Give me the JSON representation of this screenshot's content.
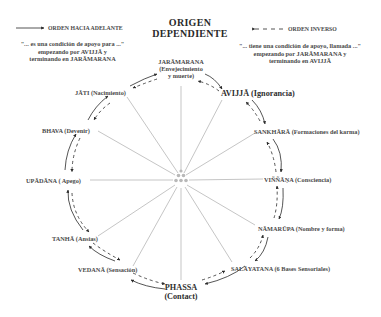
{
  "title": {
    "line1": "ORIGEN",
    "line2": "DEPENDIENTE"
  },
  "legend": {
    "forward": {
      "label": "ORDEN HACIA ADELANTE",
      "line_style": "solid",
      "note_lines": [
        "\"... es una condición de apoyo para ...\"",
        "empezando por AVIJJĀ y",
        "terminando en JARĀMARANA"
      ]
    },
    "reverse": {
      "label": "ORDEN INVERSO",
      "line_style": "dashed",
      "note_lines": [
        "\"... tiene una condición de apoyo, llamada ...\"",
        "empezando por JARĀMARANA y",
        "terminando en AVIJJĀ"
      ]
    }
  },
  "nodes": [
    {
      "id": "jaramarana",
      "name": "JARĀMARANA",
      "desc": "(Envejecimiento",
      "desc2": "y muerte)"
    },
    {
      "id": "avijja",
      "name": "AVIJJĀ",
      "desc": "(Ignorancia)"
    },
    {
      "id": "sankhara",
      "name": "SANKHĀRĀ",
      "desc": "(Formaciones del karma)"
    },
    {
      "id": "vinnana",
      "name": "VIÑÑĀṆA",
      "desc": "(Consciencia)"
    },
    {
      "id": "namarupa",
      "name": "NĀMARŪPA",
      "desc": "(Nombre y forma)"
    },
    {
      "id": "salayatana",
      "name": "SALĀYATANA",
      "desc": "(6 Bases Sensoriales)"
    },
    {
      "id": "phassa",
      "name": "PHASSA",
      "desc": "(Contact)"
    },
    {
      "id": "vedana",
      "name": "VEDANĀ",
      "desc": "(Sensación)"
    },
    {
      "id": "tanha",
      "name": "TANHĀ",
      "desc": "(Ansias)"
    },
    {
      "id": "upadana",
      "name": "UPĀDĀNA",
      "desc": "( Apego)"
    },
    {
      "id": "bhava",
      "name": "BHAVA",
      "desc": "(Devenir)"
    },
    {
      "id": "jati",
      "name": "JĀTI",
      "desc": "(Nacimiento)"
    }
  ],
  "colors": {
    "text": "#4a4a4a",
    "spokes": "#8a8a8a",
    "arrows": "#2a2a2a",
    "center_dots": "#b8b8b8"
  }
}
